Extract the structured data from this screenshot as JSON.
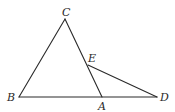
{
  "diagram": {
    "type": "geometry",
    "points": {
      "C": {
        "label": "C",
        "x": 65,
        "y": 19,
        "lx": 62,
        "ly": 16
      },
      "B": {
        "label": "B",
        "x": 19,
        "y": 97,
        "lx": 7,
        "ly": 101
      },
      "A": {
        "label": "A",
        "x": 102,
        "y": 97,
        "lx": 98,
        "ly": 110
      },
      "D": {
        "label": "D",
        "x": 157,
        "y": 97,
        "lx": 160,
        "ly": 101
      },
      "E": {
        "label": "E",
        "x": 88,
        "y": 65,
        "lx": 88,
        "ly": 62
      }
    },
    "segments": [
      {
        "from": "C",
        "to": "B"
      },
      {
        "from": "C",
        "to": "A"
      },
      {
        "from": "B",
        "to": "D"
      },
      {
        "from": "E",
        "to": "D"
      }
    ],
    "stroke_color": "#2a2a2a"
  }
}
